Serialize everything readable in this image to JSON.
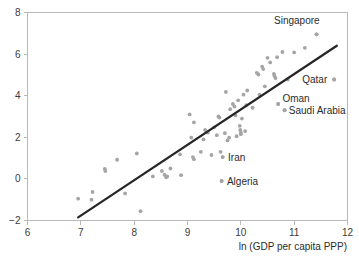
{
  "chart_data": {
    "type": "scatter",
    "title": "",
    "xlabel": "ln (GDP per capita PPP)",
    "ylabel": "",
    "xlim": [
      6,
      12
    ],
    "ylim": [
      -2,
      8
    ],
    "xticks": [
      6,
      7,
      8,
      9,
      10,
      11,
      12
    ],
    "yticks": [
      -2,
      0,
      2,
      4,
      6,
      8
    ],
    "xtick_labels": [
      "6",
      "7",
      "8",
      "9",
      "10",
      "11",
      "12"
    ],
    "ytick_labels": [
      "−2",
      "0",
      "2",
      "4",
      "6",
      "8"
    ],
    "grid": false,
    "legend": "none",
    "point_color": "#a5a5a5",
    "line_color": "#262626",
    "frame_color": "#b9b9b9",
    "trend_line": {
      "x_start": 6.95,
      "y_start": -1.85,
      "x_end": 11.8,
      "y_end": 6.4
    },
    "points": [
      {
        "x": 6.95,
        "y": -0.95
      },
      {
        "x": 7.2,
        "y": -1.0
      },
      {
        "x": 7.22,
        "y": -0.63
      },
      {
        "x": 7.45,
        "y": 0.48
      },
      {
        "x": 7.46,
        "y": 0.38
      },
      {
        "x": 7.68,
        "y": 0.92
      },
      {
        "x": 7.83,
        "y": -0.7
      },
      {
        "x": 8.05,
        "y": 1.22
      },
      {
        "x": 8.12,
        "y": -1.55
      },
      {
        "x": 8.35,
        "y": 0.12
      },
      {
        "x": 8.52,
        "y": 0.38
      },
      {
        "x": 8.57,
        "y": 0.2
      },
      {
        "x": 8.6,
        "y": 0.08
      },
      {
        "x": 8.62,
        "y": 0.12
      },
      {
        "x": 8.68,
        "y": 0.5
      },
      {
        "x": 8.88,
        "y": 0.18
      },
      {
        "x": 8.86,
        "y": 1.18
      },
      {
        "x": 9.04,
        "y": 3.1
      },
      {
        "x": 9.07,
        "y": 1.98
      },
      {
        "x": 9.1,
        "y": 1.05
      },
      {
        "x": 9.12,
        "y": 0.95
      },
      {
        "x": 9.12,
        "y": 2.72
      },
      {
        "x": 9.25,
        "y": 1.3
      },
      {
        "x": 9.3,
        "y": 1.9
      },
      {
        "x": 9.33,
        "y": 2.35
      },
      {
        "x": 9.38,
        "y": 2.22
      },
      {
        "x": 9.45,
        "y": 1.15
      },
      {
        "x": 9.5,
        "y": 2.48
      },
      {
        "x": 9.55,
        "y": 2.1
      },
      {
        "x": 9.58,
        "y": 3.0
      },
      {
        "x": 9.6,
        "y": 2.95
      },
      {
        "x": 9.62,
        "y": 1.3
      },
      {
        "x": 9.64,
        "y": -0.1
      },
      {
        "x": 9.66,
        "y": 1.05
      },
      {
        "x": 9.7,
        "y": 2.2
      },
      {
        "x": 9.72,
        "y": 4.18
      },
      {
        "x": 9.75,
        "y": 1.85
      },
      {
        "x": 9.78,
        "y": 1.98
      },
      {
        "x": 9.8,
        "y": 3.35
      },
      {
        "x": 9.85,
        "y": 3.6
      },
      {
        "x": 9.88,
        "y": 3.48
      },
      {
        "x": 9.9,
        "y": 3.05
      },
      {
        "x": 9.92,
        "y": 2.05
      },
      {
        "x": 9.95,
        "y": 3.78
      },
      {
        "x": 9.98,
        "y": 2.55
      },
      {
        "x": 9.99,
        "y": 2.35
      },
      {
        "x": 10.0,
        "y": 2.22
      },
      {
        "x": 10.0,
        "y": 2.15
      },
      {
        "x": 10.02,
        "y": 2.9
      },
      {
        "x": 10.05,
        "y": 4.05
      },
      {
        "x": 10.08,
        "y": 2.3
      },
      {
        "x": 10.1,
        "y": 3.55
      },
      {
        "x": 10.12,
        "y": 4.25
      },
      {
        "x": 10.22,
        "y": 3.42
      },
      {
        "x": 10.3,
        "y": 5.1
      },
      {
        "x": 10.33,
        "y": 5.02
      },
      {
        "x": 10.35,
        "y": 4.05
      },
      {
        "x": 10.4,
        "y": 5.4
      },
      {
        "x": 10.42,
        "y": 5.28
      },
      {
        "x": 10.45,
        "y": 4.45
      },
      {
        "x": 10.5,
        "y": 5.82
      },
      {
        "x": 10.55,
        "y": 5.6
      },
      {
        "x": 10.62,
        "y": 5.05
      },
      {
        "x": 10.63,
        "y": 4.95
      },
      {
        "x": 10.65,
        "y": 4.85
      },
      {
        "x": 10.68,
        "y": 5.85
      },
      {
        "x": 10.7,
        "y": 3.6
      },
      {
        "x": 10.78,
        "y": 6.1
      },
      {
        "x": 10.82,
        "y": 3.3
      },
      {
        "x": 10.88,
        "y": 4.78
      },
      {
        "x": 11.0,
        "y": 6.08
      },
      {
        "x": 11.2,
        "y": 6.3
      },
      {
        "x": 11.42,
        "y": 6.95
      },
      {
        "x": 11.75,
        "y": 4.78
      }
    ],
    "annotations": [
      {
        "text": "Singapore",
        "x": 11.42,
        "y": 6.95,
        "label_x": 11.05,
        "label_y": 7.6,
        "anchor": "middle"
      },
      {
        "text": "Qatar",
        "x": 11.75,
        "y": 4.78,
        "label_x": 11.62,
        "label_y": 4.78,
        "anchor": "end"
      },
      {
        "text": "Oman",
        "x": 10.7,
        "y": 3.6,
        "label_x": 10.78,
        "label_y": 3.88,
        "anchor": "start"
      },
      {
        "text": "Saudi Arabia",
        "x": 10.82,
        "y": 3.3,
        "label_x": 10.9,
        "label_y": 3.28,
        "anchor": "start"
      },
      {
        "text": "Iran",
        "x": 9.66,
        "y": 1.05,
        "label_x": 9.76,
        "label_y": 1.03,
        "anchor": "start"
      },
      {
        "text": "Algeria",
        "x": 9.64,
        "y": -0.1,
        "label_x": 9.74,
        "label_y": -0.13,
        "anchor": "start"
      }
    ]
  }
}
